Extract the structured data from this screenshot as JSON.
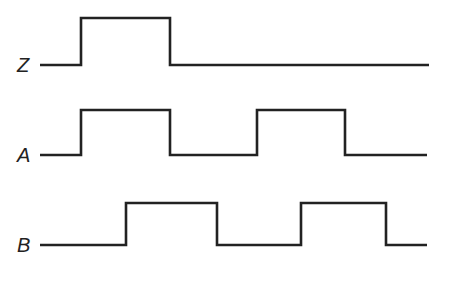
{
  "diagram": {
    "type": "timing-diagram",
    "line_color": "#222222",
    "signals": [
      {
        "name": "Z",
        "label_pos": [
          17,
          55
        ],
        "low_y": 65,
        "high_y": 18,
        "points": [
          [
            40,
            65
          ],
          [
            81,
            65
          ],
          [
            81,
            18
          ],
          [
            170,
            18
          ],
          [
            170,
            65
          ],
          [
            429,
            65
          ]
        ]
      },
      {
        "name": "A",
        "label_pos": [
          17,
          145
        ],
        "low_y": 155,
        "high_y": 110,
        "points": [
          [
            40,
            155
          ],
          [
            81,
            155
          ],
          [
            81,
            110
          ],
          [
            170,
            110
          ],
          [
            170,
            155
          ],
          [
            257,
            155
          ],
          [
            257,
            110
          ],
          [
            345,
            110
          ],
          [
            345,
            155
          ],
          [
            427,
            155
          ]
        ]
      },
      {
        "name": "B",
        "label_pos": [
          17,
          235
        ],
        "low_y": 245,
        "high_y": 203,
        "points": [
          [
            40,
            245
          ],
          [
            126,
            245
          ],
          [
            126,
            203
          ],
          [
            217,
            203
          ],
          [
            217,
            245
          ],
          [
            301,
            245
          ],
          [
            301,
            203
          ],
          [
            386,
            203
          ],
          [
            386,
            245
          ],
          [
            427,
            245
          ]
        ]
      }
    ]
  }
}
